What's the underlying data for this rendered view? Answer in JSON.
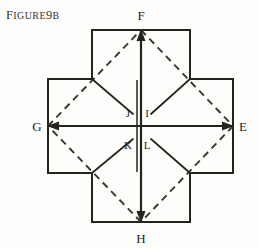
{
  "caption": {
    "lead": "F",
    "rest": "IGURE",
    "number": "9",
    "suffix": "B",
    "full": "FIGURE 9B"
  },
  "figure": {
    "background_color": "#fdfdfc",
    "line_color": "#26231f",
    "dash_color": "#3a3531",
    "stroke_width": 2.0,
    "inner_stroke_width": 1.6,
    "dash_pattern": "7 5"
  },
  "labels": {
    "outer": [
      {
        "name": "F",
        "text": "F",
        "x": 141,
        "y": 20,
        "anchor": "middle",
        "position": "top"
      },
      {
        "name": "E",
        "text": "E",
        "x": 243,
        "y": 131,
        "anchor": "middle",
        "position": "right"
      },
      {
        "name": "H",
        "text": "H",
        "x": 141,
        "y": 243,
        "anchor": "middle",
        "position": "bottom"
      },
      {
        "name": "G",
        "text": "G",
        "x": 37,
        "y": 131,
        "anchor": "middle",
        "position": "left"
      }
    ],
    "inner": [
      {
        "name": "J",
        "text": "J",
        "x": 128,
        "y": 116,
        "anchor": "middle",
        "position": "upper-left-of-center"
      },
      {
        "name": "I",
        "text": "I",
        "x": 147,
        "y": 116,
        "anchor": "middle",
        "position": "upper-right-of-center"
      },
      {
        "name": "K",
        "text": "K",
        "x": 128,
        "y": 148,
        "anchor": "middle",
        "position": "lower-left-of-center"
      },
      {
        "name": "L",
        "text": "L",
        "x": 147,
        "y": 148,
        "anchor": "middle",
        "position": "lower-right-of-center"
      }
    ]
  },
  "geometry": {
    "cross_outline_points": "92,30 190,30 190,79 233,79 233,173 190,173 190,222 92,222 92,173 48,173 48,79 92,79",
    "axis_vertical": {
      "x1": 141,
      "y1": 30,
      "x2": 141,
      "y2": 222
    },
    "axis_vertical_second": {
      "x1": 137,
      "y1": 79,
      "x2": 137,
      "y2": 173
    },
    "axis_horizontal": {
      "x1": 48,
      "y1": 126,
      "x2": 233,
      "y2": 126
    },
    "arrow_tips": [
      {
        "name": "arrow-f",
        "x": 141,
        "y": 30,
        "dir": "up"
      },
      {
        "name": "arrow-e",
        "x": 233,
        "y": 126,
        "dir": "right"
      },
      {
        "name": "arrow-h",
        "x": 141,
        "y": 222,
        "dir": "down"
      },
      {
        "name": "arrow-g",
        "x": 48,
        "y": 126,
        "dir": "left"
      }
    ],
    "fold_lines_solid": [
      {
        "name": "fold-top-left",
        "x1": 92,
        "y1": 79,
        "x2": 133,
        "y2": 114
      },
      {
        "name": "fold-top-right",
        "x1": 190,
        "y1": 79,
        "x2": 151,
        "y2": 114
      },
      {
        "name": "fold-bottom-left",
        "x1": 92,
        "y1": 173,
        "x2": 133,
        "y2": 139
      },
      {
        "name": "fold-bottom-right",
        "x1": 190,
        "y1": 173,
        "x2": 151,
        "y2": 139
      }
    ],
    "dashed_diamond": [
      {
        "name": "dash-f-e",
        "x1": 141,
        "y1": 30,
        "x2": 233,
        "y2": 126
      },
      {
        "name": "dash-e-h",
        "x1": 233,
        "y1": 126,
        "x2": 141,
        "y2": 222
      },
      {
        "name": "dash-h-g",
        "x1": 141,
        "y1": 222,
        "x2": 48,
        "y2": 126
      },
      {
        "name": "dash-g-f",
        "x1": 48,
        "y1": 126,
        "x2": 141,
        "y2": 30
      }
    ]
  }
}
